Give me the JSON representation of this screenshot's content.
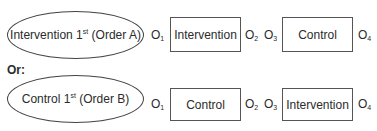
{
  "rows": [
    {
      "condition_main": "Intervention 1",
      "condition_sup": "st",
      "condition_tail": " (Order A)",
      "obs": [
        {
          "letter": "O",
          "sub": "1"
        },
        {
          "letter": "O",
          "sub": "2"
        },
        {
          "letter": "O",
          "sub": "3"
        },
        {
          "letter": "O",
          "sub": "4"
        }
      ],
      "box1": "Intervention",
      "box2": "Control"
    },
    {
      "condition_main": "Control 1",
      "condition_sup": "st",
      "condition_tail": " (Order B)",
      "obs": [
        {
          "letter": "O",
          "sub": "1"
        },
        {
          "letter": "O",
          "sub": "2"
        },
        {
          "letter": "O",
          "sub": "3"
        },
        {
          "letter": "O",
          "sub": "4"
        }
      ],
      "box1": "Control",
      "box2": "Intervention"
    }
  ],
  "separator": "Or:"
}
